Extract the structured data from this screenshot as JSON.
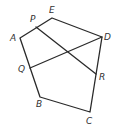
{
  "diagram": {
    "title": "",
    "points": {
      "A": {
        "label": "A",
        "x": 20,
        "y": 38,
        "lx": 10,
        "ly": 41
      },
      "E": {
        "label": "E",
        "x": 52,
        "y": 18,
        "lx": 49,
        "ly": 13
      },
      "D": {
        "label": "D",
        "x": 102,
        "y": 37,
        "lx": 104,
        "ly": 40
      },
      "C": {
        "label": "C",
        "x": 90,
        "y": 112,
        "lx": 86,
        "ly": 124
      },
      "B": {
        "label": "B",
        "x": 40,
        "y": 97,
        "lx": 36,
        "ly": 107
      },
      "P": {
        "label": "P",
        "x": 36,
        "y": 27,
        "lx": 30,
        "ly": 22
      },
      "Q": {
        "label": "Q",
        "x": 30,
        "y": 68,
        "lx": 18,
        "ly": 72
      },
      "R": {
        "label": "R",
        "x": 96,
        "y": 74,
        "lx": 99,
        "ly": 80
      }
    },
    "polygon": "ABCDE",
    "segments": [
      "PR",
      "QD"
    ]
  }
}
